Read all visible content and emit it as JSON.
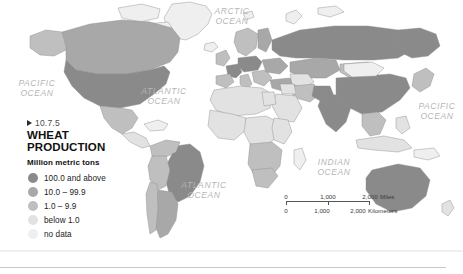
{
  "map": {
    "figure_code": "10.7.5",
    "title": "WHEAT\nPRODUCTION",
    "title_line1": "WHEAT",
    "title_line2": "PRODUCTION",
    "units_label": "Million metric tons",
    "legend_items": [
      {
        "label": "100.0 and above",
        "color": "#8a8a8a"
      },
      {
        "label": "10.0 – 99.9",
        "color": "#a8a8a8"
      },
      {
        "label": "1.0 – 9.9",
        "color": "#bfbfbf"
      },
      {
        "label": "below 1.0",
        "color": "#e2e2e2"
      },
      {
        "label": "no data",
        "color": "#efefef"
      }
    ],
    "ocean_labels": [
      {
        "name": "pacific-ocean-west",
        "text": "PACIFIC\nOCEAN",
        "x": 8,
        "y": 78
      },
      {
        "name": "arctic-ocean",
        "text": "ARCTIC\nOCEAN",
        "x": 203,
        "y": 6
      },
      {
        "name": "atlantic-ocean-north",
        "text": "ATLANTIC\nOCEAN",
        "x": 133,
        "y": 86
      },
      {
        "name": "atlantic-ocean-south",
        "text": "ATLANTIC\nOCEAN",
        "x": 173,
        "y": 180
      },
      {
        "name": "indian-ocean",
        "text": "INDIAN\nOCEAN",
        "x": 305,
        "y": 157
      },
      {
        "name": "pacific-ocean-east",
        "text": "PACIFIC\nOCEAN",
        "x": 411,
        "y": 101
      }
    ],
    "scalebar": {
      "miles_unit": "Miles",
      "kilometers_unit": "Kilometers",
      "ticks": [
        "0",
        "1,000",
        "2,000"
      ]
    },
    "colors": {
      "land_no_data": "#efefef",
      "land_below_1": "#e2e2e2",
      "land_1_to_9": "#bfbfbf",
      "land_10_to_99": "#a8a8a8",
      "land_100_plus": "#8a8a8a",
      "border": "#8f8f8f",
      "ocean": "#ffffff",
      "ocean_label": "#b6b6b6"
    }
  }
}
